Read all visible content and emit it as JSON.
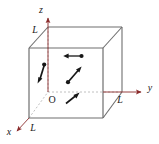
{
  "figure": {
    "background_color": "#ffffff",
    "edge_color": "#6e6e6e",
    "hidden_edge_color": "#b9b9b9",
    "axis_color": "#8a2b2b",
    "particle_color": "#171717",
    "label_color": "#1a1a1a"
  },
  "axes": [
    {
      "name": "z-axis",
      "label": "z",
      "direction": "up",
      "label_x": 44,
      "label_y": 11,
      "x1": 48,
      "y1": 92,
      "x2": 48,
      "y2": 17
    },
    {
      "name": "y-axis",
      "label": "y",
      "direction": "right",
      "label_x": 150,
      "label_y": 88,
      "x1": 48,
      "y1": 92,
      "x2": 142,
      "y2": 92
    },
    {
      "name": "x-axis",
      "label": "x",
      "direction": "down-left",
      "label_x": 8,
      "label_y": 134,
      "x1": 48,
      "y1": 92,
      "x2": 16,
      "y2": 128
    }
  ],
  "length_labels": [
    {
      "name": "z-length-label",
      "text": "L",
      "x": 34,
      "y": 33
    },
    {
      "name": "y-length-label",
      "text": "L",
      "x": 120,
      "y": 101
    },
    {
      "name": "x-length-label",
      "text": "L",
      "x": 33,
      "y": 129
    }
  ],
  "origin": {
    "name": "origin-label",
    "text": "O",
    "x": 51,
    "y": 102
  },
  "cube": {
    "side_label": "L",
    "front_face": [
      {
        "x": 29,
        "y": 48
      },
      {
        "x": 103,
        "y": 48
      },
      {
        "x": 103,
        "y": 118
      },
      {
        "x": 29,
        "y": 118
      }
    ],
    "back_face": [
      {
        "x": 48,
        "y": 27
      },
      {
        "x": 122,
        "y": 27
      },
      {
        "x": 122,
        "y": 92
      },
      {
        "x": 48,
        "y": 92
      }
    ]
  },
  "particles": [
    {
      "name": "particle-left-moving",
      "dot_x": 81,
      "dot_y": 56,
      "tip_x": 64,
      "tip_y": 56,
      "direction": "left"
    },
    {
      "name": "particle-center-upright",
      "dot_x": 68,
      "dot_y": 82,
      "tip_x": 81,
      "tip_y": 67,
      "direction": "up-right"
    },
    {
      "name": "particle-left-downleft",
      "dot_x": 44,
      "dot_y": 65,
      "tip_x": 38,
      "tip_y": 83,
      "direction": "down-left"
    },
    {
      "name": "particle-bottom-upright",
      "dot_x": 65,
      "dot_y": 104,
      "tip_x": 79,
      "tip_y": 93,
      "direction": "up-right"
    }
  ]
}
